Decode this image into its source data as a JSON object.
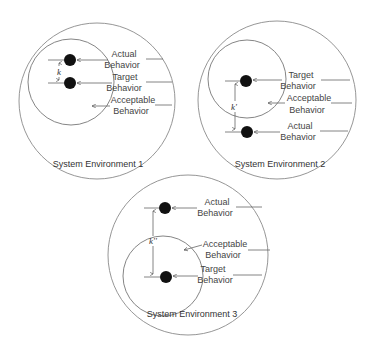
{
  "diagram": {
    "environments": [
      {
        "title": "System Environment 1",
        "distance_label": "k",
        "labels": {
          "actual": [
            "Actual",
            "Behavior"
          ],
          "target": [
            "Target",
            "Behavior"
          ],
          "acceptable": [
            "Acceptable",
            "Behavior"
          ]
        },
        "actual_inside_acceptable": true
      },
      {
        "title": "System Environment 2",
        "distance_label": "k'",
        "labels": {
          "target": [
            "Target",
            "Behavior"
          ],
          "acceptable": [
            "Acceptable",
            "Behavior"
          ],
          "actual": [
            "Actual",
            "Behavior"
          ]
        },
        "actual_inside_acceptable": false
      },
      {
        "title": "System Environment 3",
        "distance_label": "k''",
        "labels": {
          "actual": [
            "Actual",
            "Behavior"
          ],
          "acceptable": [
            "Acceptable",
            "Behavior"
          ],
          "target": [
            "Target",
            "Behavior"
          ]
        },
        "actual_inside_acceptable": false
      }
    ]
  }
}
